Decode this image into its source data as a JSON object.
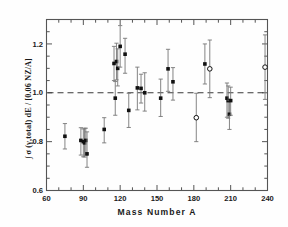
{
  "chart_data": {
    "type": "scatter",
    "title": "",
    "xlabel": "Mass Number  A",
    "ylabel": "∫ σ (γ,total) dE / [0.06 NZ/A]",
    "ylabel_parts": {
      "integral": "∫",
      "sigma": "σ",
      "arg": "(γ,total)",
      "de": "dE",
      "slash": "/",
      "denom": "[0.06 NZ/A]"
    },
    "xlim": [
      60,
      240
    ],
    "ylim": [
      0.6,
      1.3
    ],
    "xticks": [
      60,
      90,
      120,
      150,
      180,
      210,
      240
    ],
    "xticklabels": [
      "60",
      "90",
      "120",
      "150",
      "180",
      "210",
      "240"
    ],
    "xminor_step": 10,
    "yticks": [
      0.6,
      0.8,
      1.0,
      1.2
    ],
    "yticklabels": [
      "0.6",
      "0.8",
      "1.0",
      "1.2"
    ],
    "yminor_step": 0.05,
    "grid": false,
    "legend": false,
    "reference_line": {
      "y": 1.0,
      "style": "dashed",
      "color": "#3a3a3a"
    },
    "marker_filled": "square",
    "marker_open": "circle",
    "series": [
      {
        "name": "filled-square",
        "marker": "filled-square",
        "points": [
          {
            "x": 75,
            "y": 0.822,
            "yerr_lo": 0.052,
            "yerr_hi": 0.052
          },
          {
            "x": 88,
            "y": 0.805,
            "yerr_lo": 0.06,
            "yerr_hi": 0.052
          },
          {
            "x": 90,
            "y": 0.8,
            "yerr_lo": 0.062,
            "yerr_hi": 0.052
          },
          {
            "x": 91,
            "y": 0.795,
            "yerr_lo": 0.058,
            "yerr_hi": 0.06
          },
          {
            "x": 92,
            "y": 0.805,
            "yerr_lo": 0.06,
            "yerr_hi": 0.05
          },
          {
            "x": 93,
            "y": 0.75,
            "yerr_lo": 0.055,
            "yerr_hi": 0.09
          },
          {
            "x": 107,
            "y": 0.85,
            "yerr_lo": 0.055,
            "yerr_hi": 0.048
          },
          {
            "x": 115,
            "y": 1.12,
            "yerr_lo": 0.07,
            "yerr_hi": 0.07
          },
          {
            "x": 116,
            "y": 0.978,
            "yerr_lo": 0.07,
            "yerr_hi": 0.068
          },
          {
            "x": 117,
            "y": 1.128,
            "yerr_lo": 0.075,
            "yerr_hi": 0.075
          },
          {
            "x": 118,
            "y": 1.1,
            "yerr_lo": 0.072,
            "yerr_hi": 0.08
          },
          {
            "x": 120,
            "y": 1.19,
            "yerr_lo": 0.085,
            "yerr_hi": 0.085
          },
          {
            "x": 124,
            "y": 1.158,
            "yerr_lo": 0.078,
            "yerr_hi": 0.065
          },
          {
            "x": 127,
            "y": 0.928,
            "yerr_lo": 0.07,
            "yerr_hi": 0.07
          },
          {
            "x": 134,
            "y": 1.02,
            "yerr_lo": 0.09,
            "yerr_hi": 0.085
          },
          {
            "x": 137,
            "y": 1.018,
            "yerr_lo": 0.06,
            "yerr_hi": 0.058
          },
          {
            "x": 140,
            "y": 1.0,
            "yerr_lo": 0.075,
            "yerr_hi": 0.082
          },
          {
            "x": 153,
            "y": 0.978,
            "yerr_lo": 0.075,
            "yerr_hi": 0.078
          },
          {
            "x": 159,
            "y": 1.098,
            "yerr_lo": 0.092,
            "yerr_hi": 0.08
          },
          {
            "x": 163,
            "y": 1.045,
            "yerr_lo": 0.075,
            "yerr_hi": 0.058
          },
          {
            "x": 189,
            "y": 1.118,
            "yerr_lo": 0.082,
            "yerr_hi": 0.082
          },
          {
            "x": 207,
            "y": 0.978,
            "yerr_lo": 0.078,
            "yerr_hi": 0.062
          },
          {
            "x": 208,
            "y": 0.968,
            "yerr_lo": 0.072,
            "yerr_hi": 0.06
          },
          {
            "x": 209,
            "y": 0.912,
            "yerr_lo": 0.062,
            "yerr_hi": 0.058
          },
          {
            "x": 210,
            "y": 0.968,
            "yerr_lo": 0.06,
            "yerr_hi": 0.055
          }
        ]
      },
      {
        "name": "open-circle",
        "marker": "open-circle",
        "points": [
          {
            "x": 182,
            "y": 0.898,
            "yerr_lo": 0.098,
            "yerr_hi": 0.1
          },
          {
            "x": 193,
            "y": 1.098,
            "yerr_lo": 0.118,
            "yerr_hi": 0.118
          },
          {
            "x": 238,
            "y": 1.105,
            "yerr_lo": 0.132,
            "yerr_hi": 0.132
          }
        ]
      }
    ]
  },
  "figure": {
    "background": "#fefefe",
    "axis_color": "#555555",
    "marker_color": "#111111",
    "errorbar_color": "#777777"
  }
}
